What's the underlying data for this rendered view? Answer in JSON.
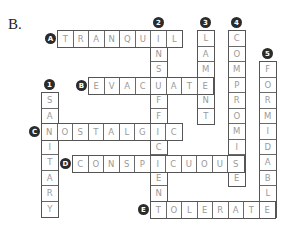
{
  "section_label": "B.",
  "cell_size": 15.5,
  "words": [
    {
      "label": "A",
      "answer": "TRANQUIL",
      "dir": "h",
      "x": 57,
      "y": 30
    },
    {
      "label": "2",
      "answer": "INSUFFICIENT",
      "dir": "v",
      "x": 150,
      "y": 30
    },
    {
      "label": "3",
      "answer": "LAMENT",
      "dir": "v",
      "x": 197,
      "y": 30
    },
    {
      "label": "4",
      "answer": "COMPROMISE",
      "dir": "v",
      "x": 228,
      "y": 30
    },
    {
      "label": "5",
      "answer": "FORMIDABLE",
      "dir": "v",
      "x": 259,
      "y": 61
    },
    {
      "label": "B",
      "answer": "EVACUATE",
      "dir": "h",
      "x": 88,
      "y": 77
    },
    {
      "label": "1",
      "answer": "SANITARY",
      "dir": "v",
      "x": 41,
      "y": 92
    },
    {
      "label": "C",
      "answer": "NOSTALGIC",
      "dir": "h",
      "x": 41,
      "y": 123
    },
    {
      "label": "D",
      "answer": "CONSPICUOUS",
      "dir": "h",
      "x": 72,
      "y": 155
    },
    {
      "label": "E",
      "answer": "TOLERATE",
      "dir": "h",
      "x": 150,
      "y": 201
    }
  ]
}
